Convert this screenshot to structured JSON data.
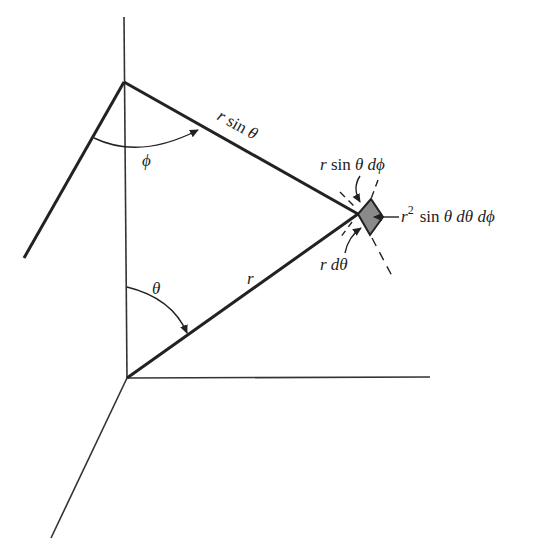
{
  "diagram": {
    "labels": {
      "r_sin_theta": "r sin θ",
      "phi": "ϕ",
      "theta": "θ",
      "r": "r",
      "r_sin_theta_dphi": "r sin θ dϕ",
      "r_dtheta": "r dθ",
      "volume_r": "r",
      "volume_exp": "2",
      "volume_rest": "sin θ dθ dϕ"
    },
    "colors": {
      "line": "#222222",
      "volume_fill": "#8a8a8a",
      "background": "#ffffff"
    }
  }
}
